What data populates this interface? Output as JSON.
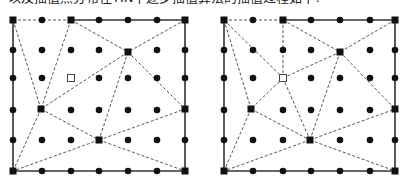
{
  "caption": "以及插值点分布在TIN中逐步插值算法的插值过程如下:",
  "colors": {
    "ink": "#111111",
    "dashed": "#555555",
    "border": "#333333",
    "background": "#ffffff"
  },
  "grid": {
    "rows_y": [
      20,
      50,
      78,
      110,
      140,
      171
    ],
    "left_cols_x": [
      13,
      42,
      71,
      99,
      128,
      157,
      185
    ],
    "right_cols_x": [
      224,
      253,
      283,
      311,
      340,
      370,
      395
    ]
  },
  "panels": [
    {
      "id": "before-insertion",
      "bounds": {
        "x1": 13,
        "y1": 20,
        "x2": 185,
        "y2": 171
      },
      "top_dashed_until_x": 71,
      "control_points": [
        [
          13,
          20
        ],
        [
          71,
          20
        ],
        [
          185,
          20
        ],
        [
          128,
          52
        ],
        [
          41,
          109
        ],
        [
          99,
          140
        ],
        [
          13,
          171
        ],
        [
          185,
          171
        ],
        [
          185,
          109
        ]
      ],
      "hollow_point": [
        71,
        78
      ],
      "edges": [
        [
          [
            13,
            20
          ],
          [
            71,
            20
          ]
        ],
        [
          [
            13,
            20
          ],
          [
            41,
            109
          ]
        ],
        [
          [
            71,
            20
          ],
          [
            41,
            109
          ]
        ],
        [
          [
            71,
            20
          ],
          [
            128,
            52
          ]
        ],
        [
          [
            185,
            20
          ],
          [
            128,
            52
          ]
        ],
        [
          [
            128,
            52
          ],
          [
            41,
            109
          ]
        ],
        [
          [
            128,
            52
          ],
          [
            99,
            140
          ]
        ],
        [
          [
            128,
            52
          ],
          [
            185,
            109
          ]
        ],
        [
          [
            41,
            109
          ],
          [
            99,
            140
          ]
        ],
        [
          [
            41,
            109
          ],
          [
            13,
            171
          ]
        ],
        [
          [
            99,
            140
          ],
          [
            185,
            109
          ]
        ],
        [
          [
            99,
            140
          ],
          [
            185,
            171
          ]
        ],
        [
          [
            99,
            140
          ],
          [
            13,
            171
          ]
        ]
      ]
    },
    {
      "id": "after-insertion",
      "bounds": {
        "x1": 224,
        "y1": 20,
        "x2": 395,
        "y2": 171
      },
      "top_dashed_until_x": 283,
      "control_points": [
        [
          224,
          20
        ],
        [
          283,
          20
        ],
        [
          395,
          20
        ],
        [
          340,
          52
        ],
        [
          251,
          109
        ],
        [
          310,
          140
        ],
        [
          224,
          171
        ],
        [
          395,
          171
        ],
        [
          395,
          109
        ]
      ],
      "hollow_point": [
        283,
        78
      ],
      "edges": [
        [
          [
            224,
            20
          ],
          [
            283,
            20
          ]
        ],
        [
          [
            224,
            20
          ],
          [
            283,
            78
          ]
        ],
        [
          [
            224,
            20
          ],
          [
            251,
            109
          ]
        ],
        [
          [
            283,
            20
          ],
          [
            283,
            78
          ]
        ],
        [
          [
            283,
            20
          ],
          [
            340,
            52
          ]
        ],
        [
          [
            395,
            20
          ],
          [
            340,
            52
          ]
        ],
        [
          [
            283,
            78
          ],
          [
            340,
            52
          ]
        ],
        [
          [
            283,
            78
          ],
          [
            251,
            109
          ]
        ],
        [
          [
            283,
            78
          ],
          [
            310,
            140
          ]
        ],
        [
          [
            340,
            52
          ],
          [
            310,
            140
          ]
        ],
        [
          [
            340,
            52
          ],
          [
            395,
            109
          ]
        ],
        [
          [
            251,
            109
          ],
          [
            310,
            140
          ]
        ],
        [
          [
            251,
            109
          ],
          [
            224,
            171
          ]
        ],
        [
          [
            310,
            140
          ],
          [
            395,
            109
          ]
        ],
        [
          [
            310,
            140
          ],
          [
            395,
            171
          ]
        ],
        [
          [
            310,
            140
          ],
          [
            224,
            171
          ]
        ]
      ]
    }
  ]
}
